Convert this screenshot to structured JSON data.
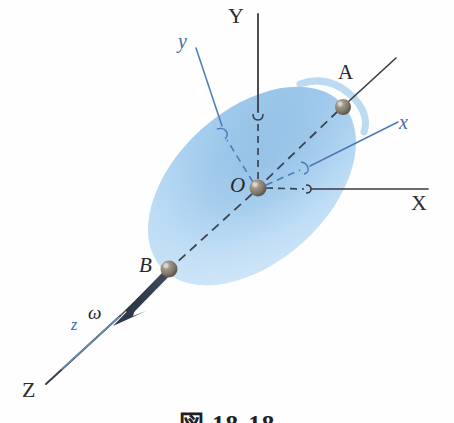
{
  "figure": {
    "kind": "engineering-mechanics-diagram",
    "caption": "図 18-18",
    "background_color": "#ffffff"
  },
  "colors": {
    "global_axis": "#3a3a42",
    "body_axis": "#4a7cb5",
    "body_fill_light": "#cfe6f8",
    "body_fill_mid": "#a8d0ef",
    "body_fill_deep": "#79b0e0",
    "sphere": "#8a8276",
    "omega_arrow": "#2f3b4a",
    "dashed_line": "#3c4450",
    "label_dark": "#26262b",
    "label_blue": "#3d6fa8"
  },
  "global_axes": [
    {
      "id": "X",
      "label": "X",
      "label_x": 411,
      "label_y": 192,
      "kind": "global-axis-label"
    },
    {
      "id": "Y",
      "label": "Y",
      "label_x": 228,
      "label_y": 5,
      "kind": "global-axis-label"
    },
    {
      "id": "Z",
      "label": "Z",
      "label_x": 22,
      "label_y": 379,
      "kind": "global-axis-label"
    }
  ],
  "body_axes": [
    {
      "id": "x",
      "label": "x",
      "label_x": 399,
      "label_y": 112,
      "kind": "body-axis-label"
    },
    {
      "id": "y",
      "label": "y",
      "label_x": 178,
      "label_y": 31,
      "kind": "body-axis-label"
    },
    {
      "id": "z",
      "label": "z",
      "label_x": 71,
      "label_y": 317,
      "kind": "body-axis-label"
    }
  ],
  "points": [
    {
      "id": "O",
      "label": "O",
      "x": 258,
      "y": 188,
      "label_x": 230,
      "label_y": 175,
      "role": "origin"
    },
    {
      "id": "A",
      "label": "A",
      "x": 343,
      "y": 107,
      "label_x": 338,
      "label_y": 62,
      "role": "axis-point-upper"
    },
    {
      "id": "B",
      "label": "B",
      "x": 169,
      "y": 269,
      "label_x": 139,
      "label_y": 255,
      "role": "axis-point-lower"
    }
  ],
  "vectors": [
    {
      "id": "omega",
      "label": "ω",
      "label_x": 88,
      "label_y": 303,
      "tail_x": 169,
      "tail_y": 269,
      "tip_x": 113,
      "tip_y": 326,
      "description": "angular velocity vector along BA axis pointing away from body"
    }
  ],
  "geometry": {
    "body": {
      "shape": "ellipse",
      "center_x": 252,
      "center_y": 186,
      "radius_x": 122,
      "radius_y": 76,
      "rotation_deg": -42
    },
    "lines": {
      "X_axis": {
        "from": [
          258,
          188
        ],
        "to": [
          428,
          188
        ],
        "style": "solid-after-dash"
      },
      "Y_axis": {
        "from": [
          258,
          188
        ],
        "to": [
          258,
          14
        ],
        "style": "dashed-then-solid"
      },
      "Z_axis": {
        "from": [
          258,
          188
        ],
        "to": [
          46,
          384
        ],
        "style": "solid"
      },
      "body_x": {
        "from": [
          258,
          188
        ],
        "to": [
          398,
          121
        ],
        "style": "dashed-then-solid-blue"
      },
      "body_y": {
        "from": [
          258,
          188
        ],
        "to": [
          196,
          45
        ],
        "style": "dashed-then-solid-blue"
      },
      "axis_AB": {
        "from": [
          343,
          107
        ],
        "to": [
          169,
          269
        ],
        "style": "dashed"
      }
    }
  }
}
